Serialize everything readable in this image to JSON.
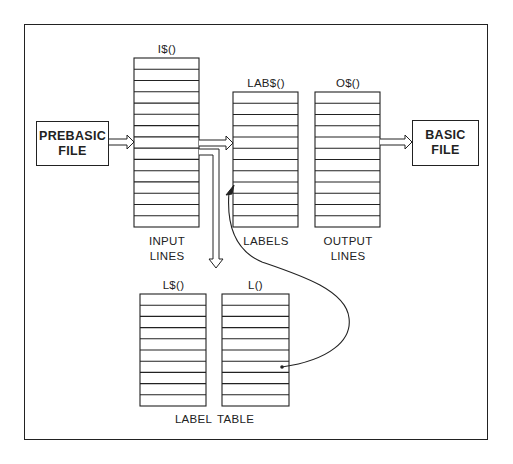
{
  "diagram": {
    "nodes": {
      "prebasic_file": {
        "line1": "PREBASIC",
        "line2": "FILE"
      },
      "basic_file": {
        "line1": "BASIC",
        "line2": "FILE"
      },
      "input_array": {
        "name": "I$()",
        "caption1": "INPUT",
        "caption2": "LINES",
        "rows": 15
      },
      "labels_array": {
        "name": "LAB$()",
        "caption1": "LABELS",
        "rows": 12
      },
      "output_array": {
        "name": "O$()",
        "caption1": "OUTPUT",
        "caption2": "LINES",
        "rows": 12
      },
      "label_names_array": {
        "name": "L$()",
        "rows": 10
      },
      "label_lines_array": {
        "name": "L()",
        "rows": 10
      },
      "label_table": {
        "caption": "LABEL TABLE"
      }
    },
    "edges": [
      {
        "from": "PREBASIC FILE",
        "to": "I$()",
        "style": "double-arrow"
      },
      {
        "from": "I$()",
        "to": "LAB$()",
        "style": "double-arrow"
      },
      {
        "from": "I$()",
        "to": "LABEL TABLE",
        "style": "double-arrow-down"
      },
      {
        "from": "O$()",
        "to": "BASIC FILE",
        "style": "double-arrow"
      },
      {
        "from": "L()",
        "to": "LAB$()",
        "style": "curved-pointer"
      }
    ]
  }
}
